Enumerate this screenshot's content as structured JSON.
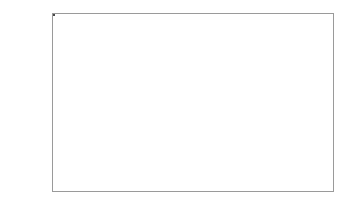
{
  "chart_data": {
    "type": "box",
    "title": "",
    "xlabel": "",
    "ylabel": "Film thickness",
    "ylim": [
      514,
      624
    ],
    "yticks": [
      520,
      540,
      560,
      580,
      600,
      620
    ],
    "ytick_labels": [
      "520",
      "540",
      "560",
      "580",
      "600",
      "620"
    ],
    "grid": false,
    "legend": "none",
    "categories": [
      ""
    ],
    "boxes": [
      {
        "name": "Film thickness",
        "min": 521,
        "q1": 551,
        "median": 572,
        "q3": 592,
        "max": 615,
        "fill_color": "#8a8a8a",
        "edge_color": "#4a4a4a"
      }
    ]
  },
  "axes": {
    "frame_color": "#9a9a9a",
    "background": "#ffffff"
  }
}
